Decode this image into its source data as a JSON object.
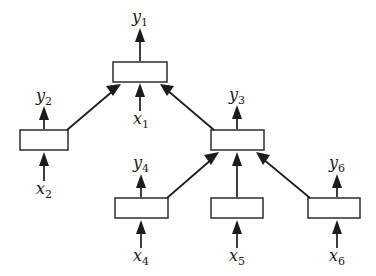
{
  "diagram": {
    "type": "hierarchical-block-diagram",
    "title": "",
    "background_color": "#ffffff",
    "line_color": "#1c1c1c",
    "box_stroke_color": "#3a3a3a",
    "box_fill_color": "#ffffff",
    "blocks": [
      {
        "id": "block-1",
        "x": 113,
        "y": 62,
        "w": 54,
        "h": 20,
        "input_label": "x1",
        "output_label": "y1"
      },
      {
        "id": "block-2",
        "x": 20,
        "y": 130,
        "w": 48,
        "h": 20,
        "input_label": "x2",
        "output_label": "y2"
      },
      {
        "id": "block-3",
        "x": 211,
        "y": 130,
        "w": 53,
        "h": 20,
        "input_label": "",
        "output_label": "y3"
      },
      {
        "id": "block-4",
        "x": 115,
        "y": 198,
        "w": 53,
        "h": 20,
        "input_label": "x4",
        "output_label": "y4"
      },
      {
        "id": "block-5",
        "x": 211,
        "y": 198,
        "w": 52,
        "h": 20,
        "input_label": "x5",
        "output_label": ""
      },
      {
        "id": "block-6",
        "x": 308,
        "y": 198,
        "w": 52,
        "h": 20,
        "input_label": "x6",
        "output_label": "y6"
      }
    ],
    "labels": {
      "y1": {
        "base": "y",
        "sub": "1",
        "x": 140,
        "y": 22
      },
      "y2": {
        "base": "y",
        "sub": "2",
        "x": 44,
        "y": 101
      },
      "y3": {
        "base": "y",
        "sub": "3",
        "x": 237,
        "y": 100
      },
      "y4": {
        "base": "y",
        "sub": "4",
        "x": 141,
        "y": 168
      },
      "y6": {
        "base": "y",
        "sub": "6",
        "x": 337,
        "y": 168
      },
      "x1": {
        "base": "x",
        "sub": "1",
        "x": 141,
        "y": 124
      },
      "x2": {
        "base": "x",
        "sub": "2",
        "x": 44,
        "y": 194
      },
      "x4": {
        "base": "x",
        "sub": "4",
        "x": 141,
        "y": 261
      },
      "x5": {
        "base": "x",
        "sub": "5",
        "x": 237,
        "y": 261
      },
      "x6": {
        "base": "x",
        "sub": "6",
        "x": 337,
        "y": 261
      }
    },
    "connections": [
      {
        "id": "conn-b2-to-b1",
        "from": "block-2",
        "to": "block-1",
        "kind": "diagonal"
      },
      {
        "id": "conn-b3-to-b1",
        "from": "block-3",
        "to": "block-1",
        "kind": "diagonal"
      },
      {
        "id": "conn-b4-to-b3",
        "from": "block-4",
        "to": "block-3",
        "kind": "diagonal"
      },
      {
        "id": "conn-b5-to-b3",
        "from": "block-5",
        "to": "block-3",
        "kind": "vertical"
      },
      {
        "id": "conn-b6-to-b3",
        "from": "block-6",
        "to": "block-3",
        "kind": "diagonal"
      }
    ]
  }
}
